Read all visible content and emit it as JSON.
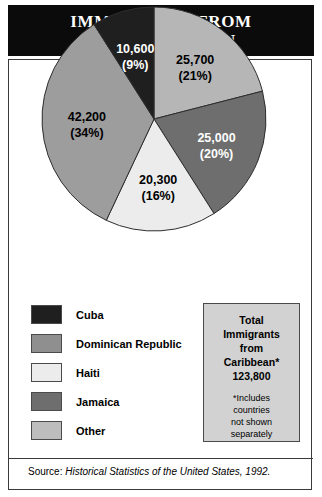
{
  "title": {
    "line1": "IMMIGRANTS FROM",
    "line2": "THE CARIBBEAN"
  },
  "chart_data": {
    "type": "pie",
    "title": "IMMIGRANTS FROM THE CARIBBEAN",
    "categories": [
      "Dominican Republic",
      "Jamaica",
      "Haiti",
      "Other",
      "Cuba"
    ],
    "values": [
      25700,
      25000,
      20300,
      42200,
      10600
    ],
    "percentages": [
      21,
      20,
      16,
      34,
      9
    ],
    "value_labels": [
      "25,700",
      "25,000",
      "20,300",
      "42,200",
      "10,600"
    ],
    "percent_labels": [
      "(21%)",
      "(20%)",
      "(16%)",
      "(34%)",
      "(9%)"
    ],
    "colors": [
      "#b6b6b6",
      "#6e6e6e",
      "#ececec",
      "#9d9d9d",
      "#1f1f1f"
    ],
    "label_text_colors": [
      "#000000",
      "#ffffff",
      "#000000",
      "#000000",
      "#ffffff"
    ],
    "start_angle_deg": 0,
    "direction": "clockwise",
    "total": 123800,
    "legend_position": "bottom-left"
  },
  "slices": [
    {
      "name": "Dominican Republic",
      "value_label": "25,700",
      "percent_label": "(21%)"
    },
    {
      "name": "Jamaica",
      "value_label": "25,000",
      "percent_label": "(20%)"
    },
    {
      "name": "Haiti",
      "value_label": "20,300",
      "percent_label": "(16%)"
    },
    {
      "name": "Other",
      "value_label": "42,200",
      "percent_label": "(34%)"
    },
    {
      "name": "Cuba",
      "value_label": "10,600",
      "percent_label": "(9%)"
    }
  ],
  "legend": {
    "items": [
      {
        "label": "Cuba",
        "color": "#1f1f1f"
      },
      {
        "label": "Dominican Republic",
        "color": "#8f8f8f"
      },
      {
        "label": "Haiti",
        "color": "#ececec"
      },
      {
        "label": "Jamaica",
        "color": "#6e6e6e"
      },
      {
        "label": "Other",
        "color": "#bdbdbd"
      }
    ]
  },
  "total_box": {
    "line1": "Total",
    "line2": "Immigrants",
    "line3": "from",
    "line4": "Caribbean*",
    "line5": "123,800",
    "note_line1": "*Includes",
    "note_line2": "countries",
    "note_line3": "not shown",
    "note_line4": "separately"
  },
  "source": {
    "label": "Source:",
    "citation": "Historical Statistics of the United States, 1992."
  }
}
